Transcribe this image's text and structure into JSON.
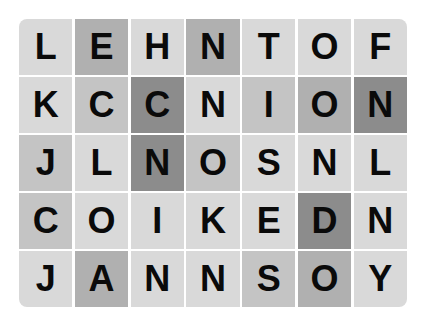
{
  "puzzle": {
    "type": "word-search-grid",
    "rows": 5,
    "cols": 7,
    "palette": {
      "light": "#d9d9d9",
      "mid_light": "#c4c4c4",
      "mid": "#b0b0b0",
      "dark": "#8c8c8c",
      "text": "#0a0a0a"
    },
    "grid": [
      [
        {
          "letter": "L",
          "shade": "light"
        },
        {
          "letter": "E",
          "shade": "mid"
        },
        {
          "letter": "H",
          "shade": "light"
        },
        {
          "letter": "N",
          "shade": "mid"
        },
        {
          "letter": "T",
          "shade": "light"
        },
        {
          "letter": "O",
          "shade": "light"
        },
        {
          "letter": "F",
          "shade": "light"
        }
      ],
      [
        {
          "letter": "K",
          "shade": "light"
        },
        {
          "letter": "C",
          "shade": "mid_light"
        },
        {
          "letter": "C",
          "shade": "dark"
        },
        {
          "letter": "N",
          "shade": "light"
        },
        {
          "letter": "I",
          "shade": "mid_light"
        },
        {
          "letter": "O",
          "shade": "mid"
        },
        {
          "letter": "N",
          "shade": "dark"
        }
      ],
      [
        {
          "letter": "J",
          "shade": "mid_light"
        },
        {
          "letter": "L",
          "shade": "light"
        },
        {
          "letter": "N",
          "shade": "dark"
        },
        {
          "letter": "O",
          "shade": "mid_light"
        },
        {
          "letter": "S",
          "shade": "light"
        },
        {
          "letter": "N",
          "shade": "light"
        },
        {
          "letter": "L",
          "shade": "light"
        }
      ],
      [
        {
          "letter": "C",
          "shade": "mid_light"
        },
        {
          "letter": "O",
          "shade": "light"
        },
        {
          "letter": "I",
          "shade": "light"
        },
        {
          "letter": "K",
          "shade": "light"
        },
        {
          "letter": "E",
          "shade": "light"
        },
        {
          "letter": "D",
          "shade": "dark"
        },
        {
          "letter": "N",
          "shade": "light"
        }
      ],
      [
        {
          "letter": "J",
          "shade": "light"
        },
        {
          "letter": "A",
          "shade": "mid"
        },
        {
          "letter": "N",
          "shade": "light"
        },
        {
          "letter": "N",
          "shade": "light"
        },
        {
          "letter": "S",
          "shade": "mid_light"
        },
        {
          "letter": "O",
          "shade": "mid"
        },
        {
          "letter": "Y",
          "shade": "light"
        }
      ]
    ]
  }
}
